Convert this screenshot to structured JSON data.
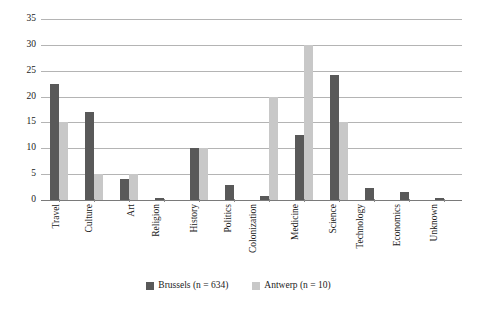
{
  "chart_data": {
    "type": "bar",
    "title": "",
    "subtitle": "",
    "xlabel": "",
    "ylabel": "",
    "ylim": [
      0,
      35
    ],
    "yticks": [
      0,
      5,
      10,
      15,
      20,
      25,
      30,
      35
    ],
    "ytick_labels": [
      "0",
      "5",
      "10",
      "15",
      "20",
      "25",
      "30",
      "35"
    ],
    "grid": true,
    "grid_axis": "y",
    "legend_position": "bottom-center",
    "categories": [
      "Travel",
      "Culture",
      "Art",
      "Religion",
      "History",
      "Politics",
      "Colonization",
      "Medicine",
      "Science",
      "Technology",
      "Economics",
      "Unknown"
    ],
    "series": [
      {
        "name": "Brussels (n = 634)",
        "key": "brussels",
        "color": "#595959",
        "values": [
          22.5,
          17,
          4,
          0.4,
          10.1,
          3,
          0.8,
          12.5,
          24.2,
          2.3,
          1.5,
          0.3
        ]
      },
      {
        "name": "Antwerp (n = 10)",
        "key": "antwerp",
        "color": "#c8c8c8",
        "values": [
          15,
          5,
          5,
          0,
          10,
          0,
          20,
          30,
          15,
          0,
          0,
          0
        ]
      }
    ]
  },
  "legend": {
    "items": [
      {
        "label": "Brussels (n = 634)",
        "key": "brussels"
      },
      {
        "label": "Antwerp (n = 10)",
        "key": "antwerp"
      }
    ]
  },
  "colors": {
    "brussels": "#595959",
    "antwerp": "#c8c8c8",
    "gridline": "#b4b4b4",
    "axis": "#7a7a7a",
    "text": "#1a1a1a",
    "background": "#ffffff"
  }
}
